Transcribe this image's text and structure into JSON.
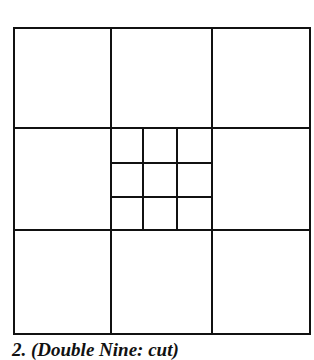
{
  "diagram": {
    "outer_grid": {
      "rows": 3,
      "cols": 3
    },
    "center_subgrid": {
      "rows": 3,
      "cols": 3
    },
    "line_color": "#111111"
  },
  "caption": "2. (Double Nine: cut)"
}
